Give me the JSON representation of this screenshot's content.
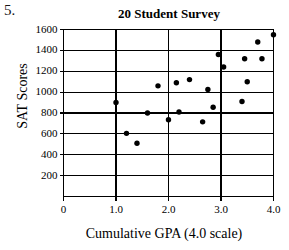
{
  "problem": {
    "number": "5."
  },
  "chart_data": {
    "type": "scatter",
    "title": "20 Student Survey",
    "xlabel": "Cumulative GPA (4.0 scale)",
    "ylabel": "SAT Scores",
    "xlim": [
      0,
      4.0
    ],
    "ylim": [
      0,
      1600
    ],
    "xticks": [
      0,
      1.0,
      2.0,
      3.0,
      4.0
    ],
    "xtick_labels": [
      "0",
      "1.0",
      "2.0",
      "3.0",
      "4.0"
    ],
    "yticks": [
      200,
      400,
      600,
      800,
      1000,
      1200,
      1400,
      1600
    ],
    "ytick_labels": [
      "200",
      "400",
      "600",
      "800",
      "1000",
      "1200",
      "1400",
      "1600"
    ],
    "grid": true,
    "grid_style": "solid-black-horizontal-and-vertical",
    "legend": false,
    "marker": "filled-circle",
    "marker_color": "#000000",
    "points": [
      {
        "x": 1.0,
        "y": 900
      },
      {
        "x": 1.2,
        "y": 605
      },
      {
        "x": 1.4,
        "y": 510
      },
      {
        "x": 1.6,
        "y": 800
      },
      {
        "x": 1.8,
        "y": 1060
      },
      {
        "x": 2.0,
        "y": 735
      },
      {
        "x": 2.15,
        "y": 1090
      },
      {
        "x": 2.2,
        "y": 810
      },
      {
        "x": 2.4,
        "y": 1120
      },
      {
        "x": 2.65,
        "y": 715
      },
      {
        "x": 2.75,
        "y": 1025
      },
      {
        "x": 2.85,
        "y": 855
      },
      {
        "x": 2.95,
        "y": 1360
      },
      {
        "x": 3.05,
        "y": 1240
      },
      {
        "x": 3.4,
        "y": 910
      },
      {
        "x": 3.45,
        "y": 1320
      },
      {
        "x": 3.5,
        "y": 1100
      },
      {
        "x": 3.7,
        "y": 1480
      },
      {
        "x": 3.78,
        "y": 1320
      },
      {
        "x": 4.0,
        "y": 1550
      }
    ]
  }
}
